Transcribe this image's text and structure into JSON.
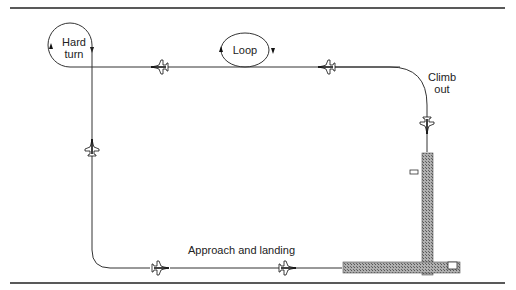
{
  "diagram": {
    "type": "flight-pattern",
    "labels": {
      "hard_turn_1": "Hard",
      "hard_turn_2": "turn",
      "loop": "Loop",
      "climb_1": "Climb",
      "climb_2": "out",
      "approach": "Approach and landing"
    },
    "colors": {
      "line": "#333333",
      "runway": "#9a9a9a",
      "rule": "#222222"
    }
  }
}
